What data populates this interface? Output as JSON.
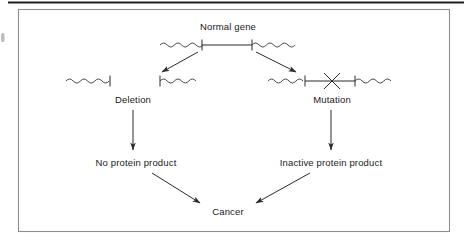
{
  "figure": {
    "type": "flow-diagram",
    "background_color": "#ffffff",
    "line_color": "#2b2b2b",
    "frame_color": "#8d8d8d",
    "text_color": "#1a1a1a"
  },
  "labels": {
    "normal_gene": "Normal gene",
    "deletion": "Deletion",
    "mutation": "Mutation",
    "no_protein": "No protein product",
    "inactive_protein": "Inactive protein product",
    "cancer": "Cancer"
  },
  "nodes": [
    {
      "id": "normal-gene",
      "label": "Normal gene",
      "level": 1,
      "glyph": "gene-bar-intact",
      "description": "Chromosome segment: wavy flanks with straight coding region bounded by two tick marks"
    },
    {
      "id": "deletion-gene",
      "label": "Deletion",
      "level": 2,
      "glyph": "gene-bar-deleted",
      "description": "Two separated chromosome fragments; coding region missing"
    },
    {
      "id": "mutation-gene",
      "label": "Mutation",
      "level": 2,
      "glyph": "gene-bar-mutated",
      "description": "Intact chromosome segment with an X marking a point mutation in the coding region"
    },
    {
      "id": "no-protein-product",
      "label": "No protein product",
      "level": 3,
      "glyph": "text"
    },
    {
      "id": "inactive-protein-product",
      "label": "Inactive protein product",
      "level": 3,
      "glyph": "text"
    },
    {
      "id": "cancer",
      "label": "Cancer",
      "level": 4,
      "glyph": "text"
    }
  ],
  "edges": [
    {
      "from": "normal-gene",
      "to": "deletion-gene",
      "style": "arrow"
    },
    {
      "from": "normal-gene",
      "to": "mutation-gene",
      "style": "arrow"
    },
    {
      "from": "deletion-gene",
      "to": "no-protein-product",
      "style": "arrow"
    },
    {
      "from": "mutation-gene",
      "to": "inactive-protein-product",
      "style": "arrow"
    },
    {
      "from": "no-protein-product",
      "to": "cancer",
      "style": "arrow"
    },
    {
      "from": "inactive-protein-product",
      "to": "cancer",
      "style": "arrow"
    }
  ]
}
